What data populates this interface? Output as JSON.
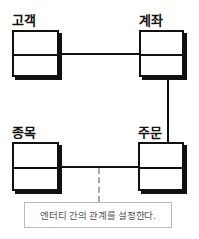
{
  "diagram": {
    "type": "entity-relationship",
    "entities": [
      {
        "id": "customer",
        "label": "고객"
      },
      {
        "id": "account",
        "label": "계좌"
      },
      {
        "id": "stock",
        "label": "종목"
      },
      {
        "id": "order",
        "label": "주문"
      }
    ],
    "relationships": [
      {
        "from": "고객",
        "to": "계좌"
      },
      {
        "from": "계좌",
        "to": "주문"
      },
      {
        "from": "종목",
        "to": "주문"
      }
    ],
    "callout": {
      "text": "엔터티 간의 관계를 설정한다."
    },
    "colors": {
      "line": "#111111",
      "callout_border": "#bbbbbb",
      "callout_text": "#555555",
      "dashed": "#aaaaaa"
    }
  }
}
